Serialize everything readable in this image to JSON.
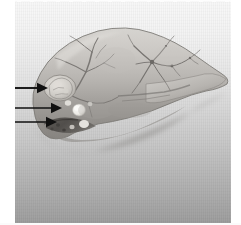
{
  "figure": {
    "kind": "pathology-photograph",
    "modality": "grayscale scanned photograph",
    "caption_text": "",
    "background": {
      "plate_top_color": "#f7f7f7",
      "plate_bottom_color": "#9a9a9a",
      "page_margin_color": "#ffffff"
    }
  },
  "specimen": {
    "label": "liver",
    "outline_fill_top": "#cfcdc9",
    "outline_fill_bottom": "#8b8884",
    "outline_stroke": "#7d7a76",
    "lobes": [
      {
        "name": "left-lobe",
        "label": "left lobe"
      },
      {
        "name": "right-lobe",
        "label": "right lobe"
      }
    ],
    "vascular_trees": [
      {
        "name": "left-vascular-tree",
        "label": "intrahepatic branching vessels (left)",
        "stroke": "#6f6c69"
      },
      {
        "name": "right-vascular-tree",
        "label": "intrahepatic branching vessels (right)",
        "stroke": "#6a6764"
      }
    ],
    "lesions": [
      {
        "name": "lesion-nodular-mass",
        "label": "nodular mass",
        "fill": "#d8d5d0"
      },
      {
        "name": "lesion-white-nodule",
        "label": "white nodule",
        "fill": "#f2f0ec"
      },
      {
        "name": "lesion-dark-infiltrate",
        "label": "dark infiltrated margin",
        "fill": "#4e4b48"
      }
    ]
  },
  "annotations": {
    "arrow_color": "#111111",
    "arrows": [
      {
        "name": "arrow-1",
        "label": "arrow 1",
        "target": "nodular mass",
        "tail_x": 8,
        "tip_x": 48,
        "y": 88
      },
      {
        "name": "arrow-2",
        "label": "arrow 2",
        "target": "white nodule",
        "tail_x": 0,
        "tip_x": 62,
        "y": 108
      },
      {
        "name": "arrow-3",
        "label": "arrow 3",
        "target": "dark infiltrated margin",
        "tail_x": 0,
        "tip_x": 57,
        "y": 122
      }
    ]
  }
}
